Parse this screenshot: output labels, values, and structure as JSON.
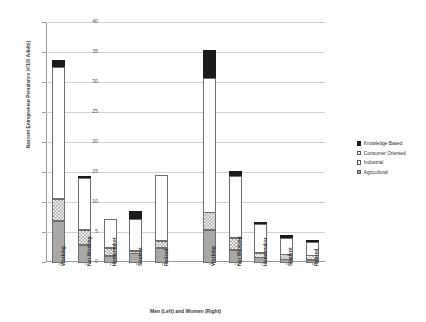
{
  "chart_data": {
    "type": "bar",
    "subtype": "stacked-bar",
    "title": "",
    "xlabel": "Men (Left) and Women (Right)",
    "ylabel": "Nascent Entrepreneur Prevalence (#/100 Adults)",
    "ylim": [
      0,
      40
    ],
    "yticks": [
      0,
      5,
      10,
      15,
      20,
      25,
      30,
      35,
      40
    ],
    "grid": true,
    "legend_position": "right",
    "categories": [
      "Working",
      "Not Working",
      "Homemaker",
      "Student",
      "Retired",
      "Working",
      "Not Working",
      "Homemaker",
      "Student",
      "Retired"
    ],
    "groups": [
      {
        "name": "Men",
        "categories": [
          "Working",
          "Not Working",
          "Homemaker",
          "Student",
          "Retired"
        ]
      },
      {
        "name": "Women",
        "categories": [
          "Working",
          "Not Working",
          "Homemaker",
          "Student",
          "Retired"
        ]
      }
    ],
    "series": [
      {
        "name": "Agricultural",
        "color": "#a8a8a8",
        "pattern": "solid-gray",
        "values": [
          7.0,
          3.0,
          1.2,
          1.6,
          2.5,
          5.5,
          2.2,
          0.9,
          0.6,
          0.5
        ]
      },
      {
        "name": "Industrial",
        "color": "#ffffff",
        "pattern": "checkerboard",
        "values": [
          3.8,
          2.6,
          1.4,
          0.5,
          1.3,
          3.0,
          2.1,
          0.9,
          0.9,
          0.9
        ]
      },
      {
        "name": "Consumer Oriented",
        "color": "#ffffff",
        "pattern": "white",
        "values": [
          22.0,
          8.7,
          4.9,
          5.4,
          11.0,
          22.5,
          10.3,
          4.8,
          2.9,
          2.2
        ]
      },
      {
        "name": "Knowledge Based",
        "color": "#1b1b1b",
        "pattern": "solid-black",
        "values": [
          1.4,
          0.5,
          0.0,
          1.5,
          0.0,
          4.8,
          1.1,
          0.6,
          0.6,
          0.6
        ]
      }
    ],
    "totals": [
      34.2,
      14.8,
      7.5,
      9.0,
      14.8,
      35.8,
      15.7,
      7.2,
      5.0,
      4.2
    ]
  },
  "legend": {
    "items": [
      {
        "label": "Knowledge Based",
        "key": "knowledge"
      },
      {
        "label": "Consumer Oriented",
        "key": "consumer"
      },
      {
        "label": "Industrial",
        "key": "industrial"
      },
      {
        "label": "Agricultural",
        "key": "agricultural"
      }
    ]
  }
}
